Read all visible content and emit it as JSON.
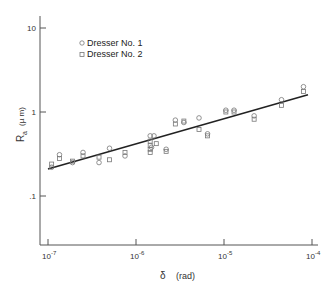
{
  "chart_data": {
    "type": "scatter",
    "title": "",
    "xlabel": "δ (rad)",
    "ylabel": "Ra (µm)",
    "xscale": "log",
    "yscale": "log",
    "xlim": [
      1e-07,
      0.0001
    ],
    "ylim": [
      0.05,
      12
    ],
    "x_ticks": [
      "10^-7",
      "10^-6",
      "10^-5",
      "10^-4"
    ],
    "y_ticks": [
      "10",
      "1",
      ".1"
    ],
    "grid": false,
    "legend_position": "upper-left",
    "series": [
      {
        "name": "Dresser No. 1",
        "marker": "circle",
        "points": [
          [
            1.1e-07,
            0.22
          ],
          [
            1.35e-07,
            0.31
          ],
          [
            1.9e-07,
            0.25
          ],
          [
            2.5e-07,
            0.33
          ],
          [
            3.8e-07,
            0.25
          ],
          [
            5e-07,
            0.37
          ],
          [
            7.5e-07,
            0.3
          ],
          [
            1.45e-06,
            0.52
          ],
          [
            1.6e-06,
            0.52
          ],
          [
            1.5e-06,
            0.38
          ],
          [
            2.2e-06,
            0.36
          ],
          [
            2.8e-06,
            0.8
          ],
          [
            3.5e-06,
            0.75
          ],
          [
            5.2e-06,
            0.85
          ],
          [
            6.5e-06,
            0.55
          ],
          [
            1.05e-05,
            1.05
          ],
          [
            1.3e-05,
            1.05
          ],
          [
            2.2e-05,
            0.9
          ],
          [
            4.5e-05,
            1.4
          ],
          [
            8e-05,
            2.0
          ]
        ]
      },
      {
        "name": "Dresser No. 2",
        "marker": "square",
        "points": [
          [
            1.1e-07,
            0.24
          ],
          [
            1.35e-07,
            0.28
          ],
          [
            1.9e-07,
            0.26
          ],
          [
            2.5e-07,
            0.3
          ],
          [
            3.8e-07,
            0.29
          ],
          [
            5e-07,
            0.27
          ],
          [
            7.5e-07,
            0.33
          ],
          [
            1.45e-06,
            0.45
          ],
          [
            1.45e-06,
            0.4
          ],
          [
            1.45e-06,
            0.36
          ],
          [
            1.45e-06,
            0.33
          ],
          [
            1.7e-06,
            0.42
          ],
          [
            2.2e-06,
            0.34
          ],
          [
            2.8e-06,
            0.72
          ],
          [
            3.5e-06,
            0.78
          ],
          [
            5.2e-06,
            0.62
          ],
          [
            6.5e-06,
            0.52
          ],
          [
            1.05e-05,
            1.0
          ],
          [
            1.3e-05,
            1.0
          ],
          [
            2.2e-05,
            0.82
          ],
          [
            4.5e-05,
            1.2
          ],
          [
            8e-05,
            1.75
          ]
        ]
      }
    ],
    "fit_line": {
      "from": [
        1e-07,
        0.21
      ],
      "to": [
        9e-05,
        1.6
      ]
    }
  },
  "legend": {
    "items": [
      {
        "label": "Dresser No. 1",
        "marker": "circle"
      },
      {
        "label": "Dresser No. 2",
        "marker": "square"
      }
    ]
  },
  "axes": {
    "y_title_main": "R",
    "y_title_sub": "a",
    "y_title_unit": "(µ m)",
    "x_title_symbol": "δ",
    "x_title_unit": "(rad)"
  },
  "colors": {
    "axis": "#555555",
    "marker": "#777777",
    "fit_line": "#222222"
  }
}
